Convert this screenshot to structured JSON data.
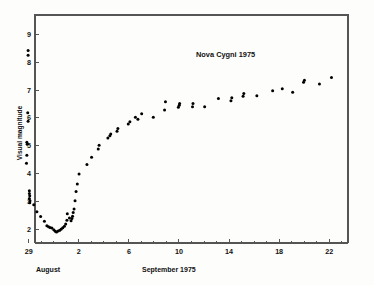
{
  "figure": {
    "background_color": "#fdfdfc",
    "axis_color": "#555555",
    "point_color": "#000000"
  },
  "annotation": {
    "title_text": "Nova Cygni 1975"
  },
  "axes": {
    "y_title": "Visual magnitude",
    "x_period_left": "August",
    "x_period_right": "September 1975"
  },
  "chart_data": {
    "type": "scatter",
    "title": "Nova Cygni 1975",
    "xlabel": "September 1975",
    "ylabel": "Visual magnitude",
    "grid": false,
    "legend": null,
    "y_inverted": true,
    "ylim": [
      9.7,
      1.5
    ],
    "xlim": [
      -1.5,
      23.5
    ],
    "x_tick_values": [
      -2,
      2,
      6,
      10,
      14,
      18,
      22
    ],
    "x_tick_labels": [
      "29",
      "2",
      "6",
      "10",
      "14",
      "18",
      "22"
    ],
    "x_minor_tick_values": [
      -1,
      0,
      1,
      3,
      4,
      5,
      7,
      8,
      9,
      11,
      12,
      13,
      15,
      16,
      17,
      19,
      20,
      21,
      23
    ],
    "y_tick_values": [
      2,
      3,
      4,
      5,
      6,
      7,
      8,
      9
    ],
    "y_tick_labels": [
      "2",
      "3",
      "4",
      "5",
      "6",
      "7",
      "8",
      "9"
    ],
    "x_axis_note": "x values are days of September 1975; negative and zero values denote late August (e.g. -2 = August 29, 0 = August 31)",
    "point_radius_px": 1.5,
    "points": [
      {
        "x": -2.05,
        "y": 8.25
      },
      {
        "x": -2.05,
        "y": 8.42
      },
      {
        "x": -2.08,
        "y": 6.18
      },
      {
        "x": -2.05,
        "y": 5.88
      },
      {
        "x": -2.15,
        "y": 5.12
      },
      {
        "x": -2.12,
        "y": 5.05
      },
      {
        "x": -2.15,
        "y": 4.66
      },
      {
        "x": -2.18,
        "y": 4.37
      },
      {
        "x": -1.95,
        "y": 3.38
      },
      {
        "x": -1.95,
        "y": 3.28
      },
      {
        "x": -1.92,
        "y": 3.2
      },
      {
        "x": -1.95,
        "y": 3.1
      },
      {
        "x": -1.9,
        "y": 3.02
      },
      {
        "x": -1.92,
        "y": 2.95
      },
      {
        "x": -1.6,
        "y": 2.88
      },
      {
        "x": -1.35,
        "y": 2.62
      },
      {
        "x": -1.05,
        "y": 2.45
      },
      {
        "x": -0.75,
        "y": 2.28
      },
      {
        "x": -0.55,
        "y": 2.12
      },
      {
        "x": -0.42,
        "y": 2.08
      },
      {
        "x": -0.3,
        "y": 2.06
      },
      {
        "x": -0.15,
        "y": 2.04
      },
      {
        "x": 0.0,
        "y": 1.98
      },
      {
        "x": 0.12,
        "y": 1.92
      },
      {
        "x": 0.22,
        "y": 1.9
      },
      {
        "x": 0.35,
        "y": 1.93
      },
      {
        "x": 0.48,
        "y": 1.96
      },
      {
        "x": 0.6,
        "y": 2.0
      },
      {
        "x": 0.72,
        "y": 2.05
      },
      {
        "x": 0.85,
        "y": 2.1
      },
      {
        "x": 0.95,
        "y": 2.18
      },
      {
        "x": 1.05,
        "y": 2.32
      },
      {
        "x": 1.08,
        "y": 2.55
      },
      {
        "x": 1.25,
        "y": 2.4
      },
      {
        "x": 1.38,
        "y": 2.3
      },
      {
        "x": 1.45,
        "y": 2.38
      },
      {
        "x": 1.5,
        "y": 2.46
      },
      {
        "x": 1.55,
        "y": 2.6
      },
      {
        "x": 1.62,
        "y": 2.72
      },
      {
        "x": 1.7,
        "y": 3.02
      },
      {
        "x": 1.78,
        "y": 3.35
      },
      {
        "x": 1.88,
        "y": 3.62
      },
      {
        "x": 2.02,
        "y": 3.98
      },
      {
        "x": 2.65,
        "y": 4.32
      },
      {
        "x": 3.02,
        "y": 4.58
      },
      {
        "x": 3.55,
        "y": 4.88
      },
      {
        "x": 3.62,
        "y": 5.02
      },
      {
        "x": 4.32,
        "y": 5.28
      },
      {
        "x": 4.48,
        "y": 5.36
      },
      {
        "x": 4.55,
        "y": 5.42
      },
      {
        "x": 5.05,
        "y": 5.52
      },
      {
        "x": 5.12,
        "y": 5.62
      },
      {
        "x": 5.95,
        "y": 5.78
      },
      {
        "x": 6.08,
        "y": 5.86
      },
      {
        "x": 6.52,
        "y": 6.02
      },
      {
        "x": 6.72,
        "y": 5.95
      },
      {
        "x": 7.02,
        "y": 6.15
      },
      {
        "x": 7.95,
        "y": 6.02
      },
      {
        "x": 8.85,
        "y": 6.28
      },
      {
        "x": 8.92,
        "y": 6.58
      },
      {
        "x": 9.95,
        "y": 6.38
      },
      {
        "x": 10.02,
        "y": 6.45
      },
      {
        "x": 10.05,
        "y": 6.52
      },
      {
        "x": 11.08,
        "y": 6.4
      },
      {
        "x": 11.12,
        "y": 6.52
      },
      {
        "x": 12.05,
        "y": 6.4
      },
      {
        "x": 13.15,
        "y": 6.7
      },
      {
        "x": 14.15,
        "y": 6.62
      },
      {
        "x": 14.22,
        "y": 6.72
      },
      {
        "x": 15.12,
        "y": 6.78
      },
      {
        "x": 15.18,
        "y": 6.88
      },
      {
        "x": 16.22,
        "y": 6.8
      },
      {
        "x": 17.48,
        "y": 6.98
      },
      {
        "x": 18.25,
        "y": 7.05
      },
      {
        "x": 19.08,
        "y": 6.92
      },
      {
        "x": 19.95,
        "y": 7.28
      },
      {
        "x": 20.02,
        "y": 7.35
      },
      {
        "x": 21.22,
        "y": 7.22
      },
      {
        "x": 22.18,
        "y": 7.45
      }
    ]
  }
}
